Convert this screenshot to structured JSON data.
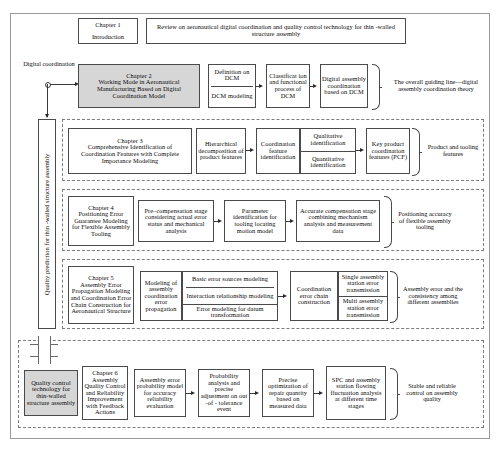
{
  "figure": {
    "outer_frame": true,
    "caption": ""
  },
  "left_labels": {
    "digital_coordination": "Digital coordination",
    "quality_prediction": "Quality prediction for thin -walled structure assembly",
    "quality_control": "Quality control technology for thin-walled structure assembly",
    "plus_icon": "plus-icon"
  },
  "rows": [
    {
      "id": "chapter1",
      "chapter_box": "Chapter 1\nIntroduction",
      "chapter_title": "Chapter 1",
      "chapter_sub": "Introduction",
      "content": "Review on aeronautical digital coordination and quality control technology for thin -walled structure assembly",
      "outcome": ""
    },
    {
      "id": "chapter2",
      "chapter_title": "Chapter 2",
      "chapter_sub": "Working Mode in Aeronautical Manufacturing Based on Digital Coordination Model",
      "shaded": true,
      "steps": [
        {
          "cells": [
            "Definition on DCM",
            "DCM modeling"
          ]
        },
        {
          "cells": [
            "Classificat ion and functional process of DCM"
          ]
        },
        {
          "cells": [
            "Digital assembly coordination based on DCM"
          ]
        }
      ],
      "outcome": "The overall guiding line—digital assembly coordination theory"
    },
    {
      "id": "chapter3",
      "chapter_title": "Chapter 3",
      "chapter_sub": "Comprehensive Identification of Coordination Features with Complete Importance Modeling",
      "shaded": false,
      "steps": [
        {
          "cells": [
            "Hierarchical decomposition of product features"
          ]
        },
        {
          "cells": [
            "Coordination feature identification"
          ]
        },
        {
          "cells": [
            "Qualitative identification",
            "Quantitative identification"
          ]
        },
        {
          "cells": [
            "Key product coordination features (PCF)"
          ]
        }
      ],
      "outcome": "Product and tooling features"
    },
    {
      "id": "chapter4",
      "chapter_title": "Chapter 4",
      "chapter_sub": "Positioning Error Guarantee Modeling for Flexible Assembly Tooling",
      "shaded": false,
      "steps": [
        {
          "cells": [
            "Pre–compensation stage considering actual error status and mechanical analysis"
          ]
        },
        {
          "cells": [
            "Parameter identification for tooling locating motion model"
          ]
        },
        {
          "cells": [
            "Accurate compensation stage combining mechanism analysis and measurement data"
          ]
        }
      ],
      "outcome": "Positioning accuracy of flexible assembly tooling"
    },
    {
      "id": "chapter5",
      "chapter_title": "Chapter 5",
      "chapter_sub": "Assembly Error Propagation Modeling and Coordination Error Chain Construction for Aeronautical Structure",
      "shaded": false,
      "steps": [
        {
          "cells": [
            "Modeling of assembly coordination error propagation"
          ]
        },
        {
          "cells": [
            "Basic error sources modeling",
            "Interaction relationship modeling",
            "Error modeling for datum transformation"
          ]
        },
        {
          "cells": [
            "Coordination error chain construction"
          ]
        },
        {
          "cells": [
            "Single assembly station error transmission",
            "Multi assembly station error transmission"
          ]
        }
      ],
      "outcome": "Assembly error and the consistency among different assemblies"
    },
    {
      "id": "chapter6",
      "chapter_title": "Chapter 6",
      "chapter_sub": "Assembly Quality Control and Reliability Improvement with Feedback Actions",
      "shaded": false,
      "steps": [
        {
          "cells": [
            "Assembly error probability model for accuracy reliability evaluation"
          ]
        },
        {
          "cells": [
            "Probability analysis and precise adjustment on out -of - tolerance event"
          ]
        },
        {
          "cells": [
            "Precise optimization of repair quantity based on measured data"
          ]
        },
        {
          "cells": [
            "SPC and assembly station flowing fluctuation analysis at different time stages"
          ]
        }
      ],
      "outcome": "Stable and reliable control on assembly quality"
    }
  ],
  "colors": {
    "shaded_fill": "#d6d6d6",
    "border": "#4a4a4a",
    "frame": "#9a9a9a",
    "dashed": "#7d7d7d"
  }
}
